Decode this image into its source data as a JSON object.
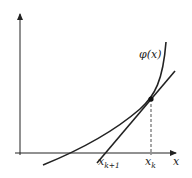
{
  "diagram": {
    "curve_label": "φ(x)",
    "x_axis_label": "x",
    "tick_labels": {
      "next_iterate": {
        "base": "x",
        "sub": "k+1"
      },
      "current_iterate": {
        "base": "x",
        "sub": "k"
      }
    },
    "colors": {
      "stroke": "#222222",
      "background": "#ffffff"
    }
  }
}
